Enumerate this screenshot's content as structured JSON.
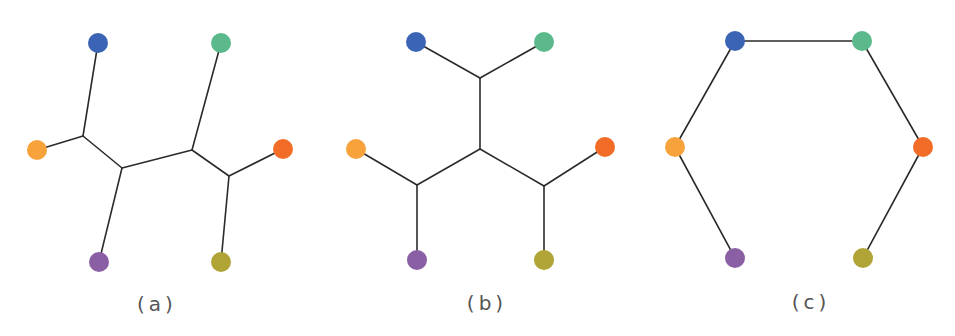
{
  "figure": {
    "colors": {
      "blue": "#3b64b5",
      "green": "#5bb98c",
      "light_orange": "#f7a23b",
      "red_orange": "#f16d27",
      "purple": "#8b5fa4",
      "olive": "#b0a436",
      "edge": "#2b2b2b",
      "label": "#555555"
    },
    "panels": [
      {
        "label": "(a)",
        "label_pos": [
          157,
          304
        ],
        "nodes": [
          {
            "id": "blue",
            "x": 98,
            "y": 43
          },
          {
            "id": "green",
            "x": 221,
            "y": 43
          },
          {
            "id": "light_orange",
            "x": 37,
            "y": 150
          },
          {
            "id": "red_orange",
            "x": 283,
            "y": 149
          },
          {
            "id": "purple",
            "x": 99,
            "y": 262
          },
          {
            "id": "olive",
            "x": 221,
            "y": 262
          }
        ],
        "junctions": [
          {
            "id": "j1",
            "x": 83,
            "y": 136
          },
          {
            "id": "j2",
            "x": 122,
            "y": 168
          },
          {
            "id": "j3",
            "x": 192,
            "y": 150
          },
          {
            "id": "j4",
            "x": 229,
            "y": 176
          }
        ],
        "edges": [
          [
            "blue",
            "j1"
          ],
          [
            "light_orange",
            "j1"
          ],
          [
            "j1",
            "j2"
          ],
          [
            "j2",
            "purple"
          ],
          [
            "j2",
            "j3"
          ],
          [
            "j3",
            "green"
          ],
          [
            "j3",
            "j4"
          ],
          [
            "j4",
            "red_orange"
          ],
          [
            "j4",
            "olive"
          ]
        ]
      },
      {
        "label": "(b)",
        "label_pos": [
          487,
          303
        ],
        "nodes": [
          {
            "id": "blue",
            "x": 416,
            "y": 42
          },
          {
            "id": "green",
            "x": 544,
            "y": 42
          },
          {
            "id": "light_orange",
            "x": 356,
            "y": 149
          },
          {
            "id": "red_orange",
            "x": 605,
            "y": 147
          },
          {
            "id": "purple",
            "x": 417,
            "y": 260
          },
          {
            "id": "olive",
            "x": 544,
            "y": 260
          }
        ],
        "junctions": [
          {
            "id": "j1",
            "x": 480,
            "y": 78
          },
          {
            "id": "j2",
            "x": 480,
            "y": 149
          },
          {
            "id": "j3",
            "x": 417,
            "y": 185
          },
          {
            "id": "j4",
            "x": 544,
            "y": 186
          }
        ],
        "edges": [
          [
            "blue",
            "j1"
          ],
          [
            "green",
            "j1"
          ],
          [
            "j1",
            "j2"
          ],
          [
            "j2",
            "j3"
          ],
          [
            "j2",
            "j4"
          ],
          [
            "light_orange",
            "j3"
          ],
          [
            "j3",
            "purple"
          ],
          [
            "red_orange",
            "j4"
          ],
          [
            "j4",
            "olive"
          ]
        ]
      },
      {
        "label": "(c)",
        "label_pos": [
          811,
          302
        ],
        "nodes": [
          {
            "id": "blue",
            "x": 735,
            "y": 41
          },
          {
            "id": "green",
            "x": 862,
            "y": 41
          },
          {
            "id": "light_orange",
            "x": 675,
            "y": 147
          },
          {
            "id": "red_orange",
            "x": 923,
            "y": 147
          },
          {
            "id": "purple",
            "x": 735,
            "y": 258
          },
          {
            "id": "olive",
            "x": 863,
            "y": 258
          }
        ],
        "junctions": [],
        "edges": [
          [
            "blue",
            "green"
          ],
          [
            "blue",
            "light_orange"
          ],
          [
            "light_orange",
            "purple"
          ],
          [
            "green",
            "red_orange"
          ],
          [
            "red_orange",
            "olive"
          ]
        ]
      }
    ],
    "node_radius": 10
  }
}
